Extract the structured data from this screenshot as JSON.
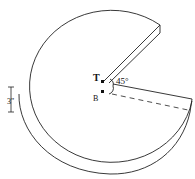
{
  "diagram": {
    "labels": {
      "top_point": "T",
      "bottom_point": "B",
      "angle": "45°",
      "thickness": "3\""
    },
    "colors": {
      "stroke": "#222222",
      "background": "#ffffff"
    }
  }
}
